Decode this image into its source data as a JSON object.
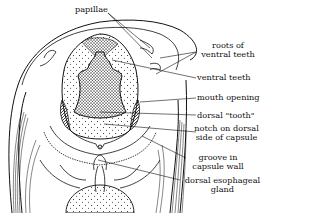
{
  "figure": {
    "labels": [
      {
        "id": "papillae",
        "lines": [
          "papillae"
        ]
      },
      {
        "id": "roots-ventral-teeth",
        "lines": [
          "roots of",
          "ventral teeth"
        ]
      },
      {
        "id": "ventral-teeth",
        "lines": [
          "ventral teeth"
        ]
      },
      {
        "id": "mouth-opening",
        "lines": [
          "mouth opening"
        ]
      },
      {
        "id": "dorsal-tooth",
        "lines": [
          "dorsal \"tooth\""
        ]
      },
      {
        "id": "notch-dorsal",
        "lines": [
          "notch on dorsal",
          "side of capsule"
        ]
      },
      {
        "id": "groove",
        "lines": [
          "groove in",
          "capsule wall"
        ]
      },
      {
        "id": "dorsal-gland",
        "lines": [
          "dorsal esophageal",
          "gland"
        ]
      }
    ],
    "colors": {
      "ink": "#111111",
      "background": "#ffffff"
    }
  }
}
